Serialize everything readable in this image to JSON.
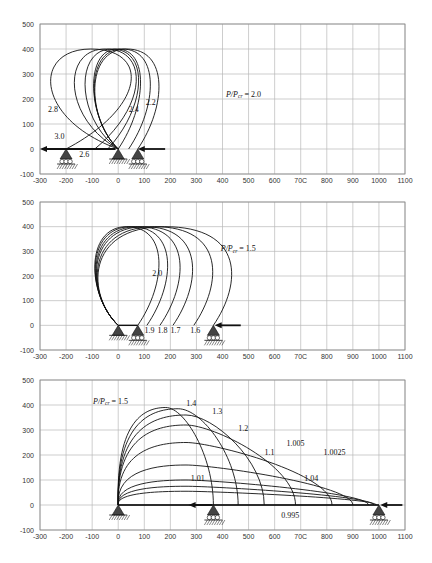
{
  "chart_data": [
    {
      "type": "line",
      "title": "",
      "xlabel": "",
      "ylabel": "",
      "xlim": [
        -300,
        1100
      ],
      "ylim": [
        -100,
        500
      ],
      "x_ticks": [
        "-300",
        "-200",
        "-100",
        "0",
        "100",
        "200",
        "300",
        "400",
        "500",
        "600",
        "70C",
        "800",
        "900",
        "1000",
        "1100"
      ],
      "y_ticks": [
        "500",
        "400",
        "300",
        "200",
        "100",
        "0",
        "-100"
      ],
      "grid": true,
      "legend": "none",
      "annotation_main": {
        "label": "P/Pcr = 2.0",
        "x": 490,
        "y": 210
      },
      "supports": [
        {
          "type": "roller",
          "x": -200
        },
        {
          "type": "pin",
          "x": 0
        },
        {
          "type": "roller",
          "x": 75
        }
      ],
      "load_arrows": [
        {
          "direction": "left",
          "x_from": -10,
          "x_to": -300,
          "y": 0
        },
        {
          "direction": "left",
          "x_from": 180,
          "x_to": 75,
          "y": 0
        }
      ],
      "series": [
        {
          "name": "2.0",
          "end_x": 75,
          "max_y": 400
        },
        {
          "name": "2.2",
          "end_x": 40,
          "max_y": 400
        },
        {
          "name": "2.4",
          "end_x": 0,
          "max_y": 400
        },
        {
          "name": "2.6",
          "end_x": -40,
          "max_y": 400
        },
        {
          "name": "2.8",
          "end_x": -90,
          "max_y": 400
        },
        {
          "name": "3.0",
          "end_x": -200,
          "max_y": 400
        }
      ],
      "curve_labels": [
        {
          "text": "2.2",
          "x": 125,
          "y": 178
        },
        {
          "text": "2.4",
          "x": 60,
          "y": 150
        },
        {
          "text": "2.6",
          "x": -130,
          "y": -30
        },
        {
          "text": "2.8",
          "x": -250,
          "y": 150
        },
        {
          "text": "3.0",
          "x": -225,
          "y": 40
        }
      ]
    },
    {
      "type": "line",
      "title": "",
      "xlabel": "",
      "ylabel": "",
      "xlim": [
        -300,
        1100
      ],
      "ylim": [
        -100,
        500
      ],
      "x_ticks": [
        "-300",
        "-200",
        "-100",
        "0",
        "100",
        "200",
        "300",
        "400",
        "500",
        "600",
        "70C",
        "800",
        "900",
        "1000",
        "1100"
      ],
      "y_ticks": [
        "500",
        "400",
        "300",
        "200",
        "100",
        "0",
        "-100"
      ],
      "grid": true,
      "legend": "none",
      "annotation_main": {
        "label": "P/Pcr = 1.5",
        "x": 470,
        "y": 300
      },
      "supports": [
        {
          "type": "pin",
          "x": 0
        },
        {
          "type": "roller",
          "x": 75
        },
        {
          "type": "roller",
          "x": 365
        }
      ],
      "load_arrows": [
        {
          "direction": "left",
          "x_from": 470,
          "x_to": 370,
          "y": 0
        }
      ],
      "series": [
        {
          "name": "2.0",
          "end_x": 75,
          "max_y": 400
        },
        {
          "name": "1.9",
          "end_x": 110,
          "max_y": 400
        },
        {
          "name": "1.8",
          "end_x": 160,
          "max_y": 400
        },
        {
          "name": "1.7",
          "end_x": 210,
          "max_y": 400
        },
        {
          "name": "1.6",
          "end_x": 290,
          "max_y": 400
        },
        {
          "name": "1.5",
          "end_x": 365,
          "max_y": 400
        }
      ],
      "curve_labels": [
        {
          "text": "2.0",
          "x": 150,
          "y": 200
        },
        {
          "text": "1.9",
          "x": 120,
          "y": -30
        },
        {
          "text": "1.8",
          "x": 170,
          "y": -30
        },
        {
          "text": "1.7",
          "x": 220,
          "y": -30
        },
        {
          "text": "1.6",
          "x": 295,
          "y": -30
        }
      ]
    },
    {
      "type": "line",
      "title": "",
      "xlabel": "",
      "ylabel": "",
      "xlim": [
        -300,
        1100
      ],
      "ylim": [
        -100,
        500
      ],
      "x_ticks": [
        "-300",
        "-200",
        "-100",
        "0",
        "100",
        "200",
        "300",
        "400",
        "500",
        "600",
        "70C",
        "800",
        "900",
        "1000",
        "1100"
      ],
      "y_ticks": [
        "500",
        "400",
        "300",
        "200",
        "100",
        "0",
        "-100"
      ],
      "grid": true,
      "legend": "none",
      "annotation_main": {
        "label": "P/Pcr = 1.5",
        "x": -20,
        "y": 405
      },
      "supports": [
        {
          "type": "pin",
          "x": 0
        },
        {
          "type": "roller",
          "x": 365
        },
        {
          "type": "roller",
          "x": 1000
        }
      ],
      "load_arrows": [
        {
          "direction": "left",
          "x_from": 1090,
          "x_to": 1005,
          "y": 0
        },
        {
          "direction": "left",
          "x_from": 360,
          "x_to": 270,
          "y": 0
        }
      ],
      "series": [
        {
          "name": "1.5",
          "end_x": 365,
          "max_y": 390
        },
        {
          "name": "1.4",
          "end_x": 460,
          "max_y": 385
        },
        {
          "name": "1.3",
          "end_x": 560,
          "max_y": 360
        },
        {
          "name": "1.2",
          "end_x": 680,
          "max_y": 320
        },
        {
          "name": "1.1",
          "end_x": 820,
          "max_y": 250
        },
        {
          "name": "1.04",
          "end_x": 900,
          "max_y": 160
        },
        {
          "name": "1.01",
          "end_x": 960,
          "max_y": 100
        },
        {
          "name": "1.005",
          "end_x": 980,
          "max_y": 75
        },
        {
          "name": "1.0025",
          "end_x": 990,
          "max_y": 55
        },
        {
          "name": "0.995",
          "end_x": 1000,
          "max_y": 0
        }
      ],
      "curve_labels": [
        {
          "text": "1.4",
          "x": 280,
          "y": 398
        },
        {
          "text": "1.3",
          "x": 380,
          "y": 365
        },
        {
          "text": "1.2",
          "x": 480,
          "y": 295
        },
        {
          "text": "1.1",
          "x": 580,
          "y": 200
        },
        {
          "text": "1.005",
          "x": 680,
          "y": 235
        },
        {
          "text": "1.0025",
          "x": 830,
          "y": 200
        },
        {
          "text": "1.04",
          "x": 740,
          "y": 95
        },
        {
          "text": "1.01",
          "x": 305,
          "y": 95
        },
        {
          "text": "0.995",
          "x": 660,
          "y": -50
        }
      ]
    }
  ]
}
